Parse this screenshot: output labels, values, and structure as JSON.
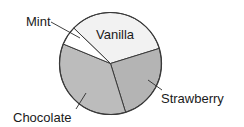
{
  "chart_data": {
    "type": "pie",
    "title": "",
    "categories": [
      "Vanilla",
      "Strawberry",
      "Chocolate",
      "Mint"
    ],
    "values": [
      33,
      25,
      36,
      6
    ],
    "units": "percent (estimated from slice angles)",
    "start_angle_deg_clockwise_from_top": 314,
    "colors": {
      "Vanilla": "#f2f2f2",
      "Strawberry": "#b4b4b4",
      "Chocolate": "#bcbcbc",
      "Mint": "#ffffff"
    },
    "labels": [
      {
        "text": "Vanilla",
        "position": "inside"
      },
      {
        "text": "Strawberry",
        "position": "outside-right",
        "leader_line": true
      },
      {
        "text": "Chocolate",
        "position": "outside-bottom-left",
        "leader_line": true
      },
      {
        "text": "Mint",
        "position": "outside-top-left",
        "leader_line": true
      }
    ],
    "legend": "none"
  },
  "labels": {
    "vanilla": "Vanilla",
    "strawberry": "Strawberry",
    "chocolate": "Chocolate",
    "mint": "Mint"
  }
}
